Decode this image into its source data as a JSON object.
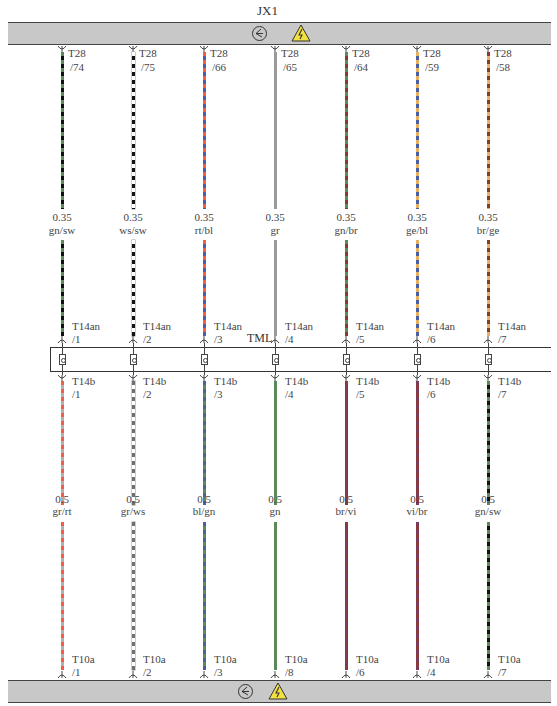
{
  "top_bus": {
    "label": "JX1",
    "icons": [
      "ground-symbol-icon",
      "high-voltage-warning-icon"
    ]
  },
  "bottom_bus": {
    "icons": [
      "ground-symbol-icon",
      "high-voltage-warning-icon"
    ]
  },
  "middle_connector": {
    "label": "TML"
  },
  "colors": {
    "gn": "#5a8a5a",
    "sw": "#111111",
    "ws": "#ffffff",
    "rt": "#f06040",
    "bl": "#4a5fa0",
    "gr": "#9a9a9a",
    "br": "#8a3a2a",
    "ge": "#e8b060",
    "vi": "#7a3a5a",
    "bus": "#c8c8c8",
    "warning": "#f0e040"
  },
  "columns": [
    {
      "x": 62,
      "top": {
        "connector": "T28",
        "pin": "/74",
        "size": "0.35",
        "color_code": "gn/sw",
        "c1": "#5a8a5a",
        "c2": "#111111"
      },
      "mid_top": {
        "connector": "T14an",
        "pin": "/1"
      },
      "mid_bottom": {
        "connector": "T14b",
        "pin": "/1"
      },
      "bottom": {
        "size": "0.5",
        "color_code": "gr/rt",
        "c1": "#f06040",
        "c2": "#b0b0b0",
        "connector": "T10a",
        "pin": "/1"
      }
    },
    {
      "x": 133,
      "top": {
        "connector": "T28",
        "pin": "/75",
        "size": "0.35",
        "color_code": "ws/sw",
        "c1": "#ffffff",
        "c2": "#111111"
      },
      "mid_top": {
        "connector": "T14an",
        "pin": "/2"
      },
      "mid_bottom": {
        "connector": "T14b",
        "pin": "/2"
      },
      "bottom": {
        "size": "0.5",
        "color_code": "gr/ws",
        "c1": "#707070",
        "c2": "#ffffff",
        "connector": "T10a",
        "pin": "/2"
      }
    },
    {
      "x": 204,
      "top": {
        "connector": "T28",
        "pin": "/66",
        "size": "0.35",
        "color_code": "rt/bl",
        "c1": "#f06040",
        "c2": "#4a5fa0"
      },
      "mid_top": {
        "connector": "T14an",
        "pin": "/3"
      },
      "mid_bottom": {
        "connector": "T14b",
        "pin": "/3"
      },
      "bottom": {
        "size": "0.5",
        "color_code": "bl/gn",
        "c1": "#4a5fa0",
        "c2": "#5a8a5a",
        "connector": "T10a",
        "pin": "/3"
      }
    },
    {
      "x": 275,
      "top": {
        "connector": "T28",
        "pin": "/65",
        "size": "0.35",
        "color_code": "gr",
        "c1": "#9a9a9a",
        "c2": "#9a9a9a"
      },
      "mid_top": {
        "connector": "T14an",
        "pin": "/4"
      },
      "mid_bottom": {
        "connector": "T14b",
        "pin": "/4"
      },
      "bottom": {
        "size": "0.5",
        "color_code": "gn",
        "c1": "#5a8a5a",
        "c2": "#5a8a5a",
        "connector": "T10a",
        "pin": "/8"
      }
    },
    {
      "x": 346,
      "top": {
        "connector": "T28",
        "pin": "/64",
        "size": "0.35",
        "color_code": "gn/br",
        "c1": "#5a8a5a",
        "c2": "#8a3a2a"
      },
      "mid_top": {
        "connector": "T14an",
        "pin": "/5"
      },
      "mid_bottom": {
        "connector": "T14b",
        "pin": "/5"
      },
      "bottom": {
        "size": "0.5",
        "color_code": "br/vi",
        "c1": "#8a3a3a",
        "c2": "#7a3a5a",
        "connector": "T10a",
        "pin": "/6"
      }
    },
    {
      "x": 417,
      "top": {
        "connector": "T28",
        "pin": "/59",
        "size": "0.35",
        "color_code": "ge/bl",
        "c1": "#e8b060",
        "c2": "#4a5fa0"
      },
      "mid_top": {
        "connector": "T14an",
        "pin": "/6"
      },
      "mid_bottom": {
        "connector": "T14b",
        "pin": "/6"
      },
      "bottom": {
        "size": "0.5",
        "color_code": "vi/br",
        "c1": "#7a3a5a",
        "c2": "#8a3a3a",
        "connector": "T10a",
        "pin": "/4"
      }
    },
    {
      "x": 488,
      "top": {
        "connector": "T28",
        "pin": "/58",
        "size": "0.35",
        "color_code": "br/ge",
        "c1": "#8a3a2a",
        "c2": "#e8b060"
      },
      "mid_top": {
        "connector": "T14an",
        "pin": "/7"
      },
      "mid_bottom": {
        "connector": "T14b",
        "pin": "/7"
      },
      "bottom": {
        "size": "0.5",
        "color_code": "gn/sw",
        "c1": "#5a8a5a",
        "c2": "#111111",
        "connector": "T10a",
        "pin": "/7"
      }
    }
  ]
}
